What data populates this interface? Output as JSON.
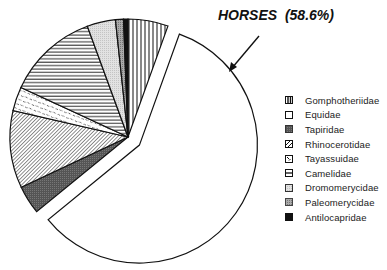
{
  "chart_data": {
    "type": "pie",
    "title": "",
    "annotation": "HORSES  (58.6%)",
    "exploded_slice": "Equidae",
    "start_angle_deg": 0,
    "direction": "clockwise",
    "slices": [
      {
        "label": "Gomphotheriidae",
        "value": 5.5,
        "pattern": "vertical-lines"
      },
      {
        "label": "Equidae",
        "value": 58.6,
        "pattern": "white"
      },
      {
        "label": "Tapiridae",
        "value": 3.9,
        "pattern": "dark-stipple"
      },
      {
        "label": "Rhinocerotidae",
        "value": 10.6,
        "pattern": "diagonal-lines"
      },
      {
        "label": "Tayassuidae",
        "value": 3.3,
        "pattern": "dashes"
      },
      {
        "label": "Camelidae",
        "value": 12.5,
        "pattern": "horizontal-lines"
      },
      {
        "label": "Dromomerycidae",
        "value": 3.9,
        "pattern": "light-stipple"
      },
      {
        "label": "Paleomerycidae",
        "value": 1.1,
        "pattern": "medium-stipple"
      },
      {
        "label": "Antilocapridae",
        "value": 0.6,
        "pattern": "black"
      }
    ],
    "legend_position": "right",
    "legend": [
      "Gomphotheriidae",
      "Equidae",
      "Tapiridae",
      "Rhinocerotidae",
      "Tayassuidae",
      "Camelidae",
      "Dromomerycidae",
      "Paleomerycidae",
      "Antilocapridae"
    ]
  },
  "annotation_label": "HORSES  (58.6%)",
  "legend": [
    {
      "label": "Gomphotheriidae",
      "pattern": "vertical-lines"
    },
    {
      "label": "Equidae",
      "pattern": "white"
    },
    {
      "label": "Tapiridae",
      "pattern": "dark-stipple"
    },
    {
      "label": "Rhinocerotidae",
      "pattern": "diagonal-lines"
    },
    {
      "label": "Tayassuidae",
      "pattern": "dashes"
    },
    {
      "label": "Camelidae",
      "pattern": "horizontal-lines"
    },
    {
      "label": "Dromomerycidae",
      "pattern": "light-stipple"
    },
    {
      "label": "Paleomerycidae",
      "pattern": "medium-stipple"
    },
    {
      "label": "Antilocapridae",
      "pattern": "black"
    }
  ]
}
